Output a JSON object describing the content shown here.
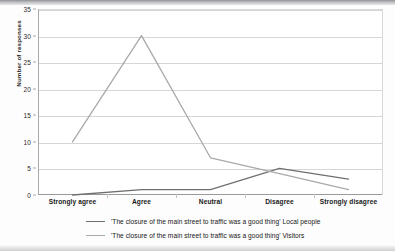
{
  "chart_data": {
    "type": "line",
    "title": "",
    "xlabel": "",
    "ylabel": "Number of responses",
    "categories": [
      "Strongly agree",
      "Agree",
      "Neutral",
      "Disagree",
      "Strongly disagree"
    ],
    "yticks": [
      0,
      5,
      10,
      15,
      20,
      25,
      30,
      35
    ],
    "ylim": [
      0,
      35
    ],
    "grid": true,
    "legend_position": "bottom",
    "series": [
      {
        "name": "'The closure of the main street to traffic was a good thing' Local people",
        "color": "#6f6f6f",
        "values": [
          0,
          1,
          1,
          5,
          3
        ]
      },
      {
        "name": "'The closure of the main street to traffic was a good thing' Visitors",
        "color": "#a9a9a9",
        "values": [
          10,
          30,
          7,
          4,
          1
        ]
      }
    ]
  },
  "axis": {
    "y_title": "Number of responses"
  }
}
